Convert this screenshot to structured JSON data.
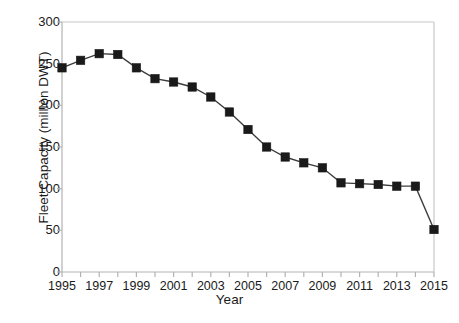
{
  "chart_data": {
    "type": "line",
    "title": "",
    "xlabel": "Year",
    "ylabel": "Fleet Capacity (million DWT)",
    "xlim": [
      1995,
      2015
    ],
    "ylim": [
      0,
      300
    ],
    "ytick_values": [
      0,
      50,
      100,
      150,
      200,
      250,
      300
    ],
    "ytick_labels": [
      "0",
      "50",
      "100",
      "150",
      "200",
      "250",
      "300"
    ],
    "xtick_values": [
      1995,
      1996,
      1997,
      1998,
      1999,
      2000,
      2001,
      2002,
      2003,
      2004,
      2005,
      2006,
      2007,
      2008,
      2009,
      2010,
      2011,
      2012,
      2013,
      2014,
      2015
    ],
    "xtick_labels": [
      "1995",
      "",
      "1997",
      "",
      "1999",
      "",
      "2001",
      "",
      "2003",
      "",
      "2005",
      "",
      "2007",
      "",
      "2009",
      "",
      "2011",
      "",
      "2013",
      "",
      "2015"
    ],
    "x": [
      1995,
      1996,
      1997,
      1998,
      1999,
      2000,
      2001,
      2002,
      2003,
      2004,
      2005,
      2006,
      2007,
      2008,
      2009,
      2010,
      2011,
      2012,
      2013,
      2014,
      2015
    ],
    "values": [
      245,
      254,
      262,
      261,
      245,
      232,
      228,
      222,
      210,
      192,
      171,
      150,
      138,
      131,
      125,
      107,
      106,
      105,
      103,
      103,
      51
    ],
    "series": [
      {
        "name": "Fleet Capacity",
        "values": [
          245,
          254,
          262,
          261,
          245,
          232,
          228,
          222,
          210,
          192,
          171,
          150,
          138,
          131,
          125,
          107,
          106,
          105,
          103,
          103,
          51
        ]
      }
    ],
    "grid": false,
    "legend": false,
    "marker": "square",
    "marker_color": "#1a1a1a",
    "line_color": "#3c3c3c",
    "axis_color": "#b3b3b3",
    "frame_color": "#c8c8c8"
  }
}
